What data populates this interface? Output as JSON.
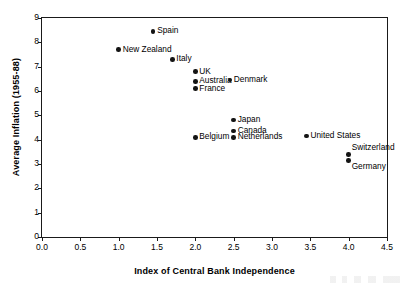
{
  "chart_data": {
    "type": "scatter",
    "title": "",
    "xlabel": "Index of Central Bank Independence",
    "ylabel": "Average Inflation (1955-88)",
    "xlim": [
      0.0,
      4.5
    ],
    "ylim": [
      0,
      9
    ],
    "xticks": [
      "0.0",
      "0.5",
      "1.0",
      "1.5",
      "2.0",
      "2.5",
      "3.0",
      "3.5",
      "4.0",
      "4.5"
    ],
    "xtick_values": [
      0.0,
      0.5,
      1.0,
      1.5,
      2.0,
      2.5,
      3.0,
      3.5,
      4.0,
      4.5
    ],
    "yticks": [
      "0",
      "1",
      "2",
      "3",
      "4",
      "5",
      "6",
      "7",
      "8",
      "9"
    ],
    "ytick_values": [
      0,
      1,
      2,
      3,
      4,
      5,
      6,
      7,
      8,
      9
    ],
    "grid": false,
    "legend": null,
    "marker_color": "#141414",
    "axis_color": "#1a1a1a",
    "points": [
      {
        "label": "Spain",
        "x": 1.45,
        "y": 8.45,
        "label_pos": "right"
      },
      {
        "label": "New Zealand",
        "x": 1.0,
        "y": 7.7,
        "label_pos": "right"
      },
      {
        "label": "Italy",
        "x": 1.7,
        "y": 7.3,
        "label_pos": "right"
      },
      {
        "label": "UK",
        "x": 2.0,
        "y": 6.8,
        "label_pos": "right"
      },
      {
        "label": "Australia",
        "x": 2.0,
        "y": 6.4,
        "label_pos": "right"
      },
      {
        "label": "France",
        "x": 2.0,
        "y": 6.1,
        "label_pos": "right"
      },
      {
        "label": "Denmark",
        "x": 2.45,
        "y": 6.45,
        "label_pos": "right"
      },
      {
        "label": "Japan",
        "x": 2.5,
        "y": 4.8,
        "label_pos": "right"
      },
      {
        "label": "Canada",
        "x": 2.5,
        "y": 4.35,
        "label_pos": "right"
      },
      {
        "label": "Netherlands",
        "x": 2.5,
        "y": 4.1,
        "label_pos": "right"
      },
      {
        "label": "Belgium",
        "x": 2.0,
        "y": 4.1,
        "label_pos": "right"
      },
      {
        "label": "United States",
        "x": 3.45,
        "y": 4.15,
        "label_pos": "right"
      },
      {
        "label": "Switzerland",
        "x": 4.0,
        "y": 3.4,
        "label_pos": "ne"
      },
      {
        "label": "Germany",
        "x": 4.0,
        "y": 3.15,
        "label_pos": "se"
      }
    ]
  }
}
